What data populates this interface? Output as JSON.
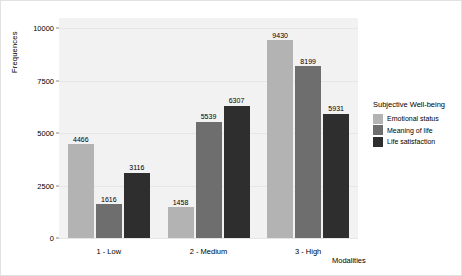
{
  "chart_data": {
    "type": "bar",
    "title": "",
    "xlabel": "Modalities",
    "ylabel": "Frequences",
    "categories": [
      "1 - Low",
      "2 - Medium",
      "3 - High"
    ],
    "series": [
      {
        "name": "Emotional status",
        "color": "#b3b3b3",
        "values": [
          4466,
          1458,
          9430
        ]
      },
      {
        "name": "Meaning of life",
        "color": "#6e6e6e",
        "values": [
          1616,
          5539,
          8199
        ]
      },
      {
        "name": "Life satisfaction",
        "color": "#2e2e2e",
        "values": [
          3116,
          6307,
          5931
        ]
      }
    ],
    "ylim": [
      0,
      10500
    ],
    "yticks": [
      0,
      2500,
      5000,
      7500,
      10000
    ],
    "ytick_labels": [
      "0",
      "2500",
      "5000",
      "7500",
      "10000"
    ],
    "grid": true,
    "legend": {
      "title": "Subjective Well-being",
      "position": "right"
    },
    "panel_background": "#f2f2f2"
  }
}
